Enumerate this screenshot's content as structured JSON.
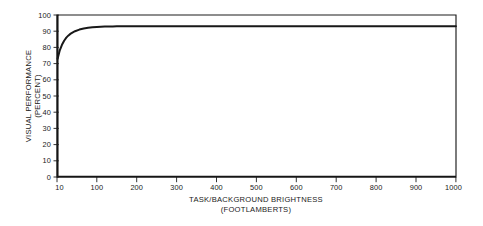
{
  "chart_data": {
    "type": "line",
    "title": "",
    "xlabel": "TASK/BACKGROUND BRIGHTNESS\n(FOOTLAMBERTS)",
    "xlabel_line1": "TASK/BACKGROUND BRIGHTNESS",
    "xlabel_line2": "(FOOTLAMBERTS)",
    "ylabel": "VISUAL PERFORMANCE\n(PERCENT)",
    "ylabel_line1": "VISUAL PERFORMANCE",
    "ylabel_line2": "(PERCENT)",
    "xlim": [
      10,
      1000
    ],
    "ylim": [
      0,
      100
    ],
    "grid": false,
    "legend": "none",
    "x_ticks": [
      10,
      100,
      200,
      300,
      400,
      500,
      600,
      700,
      800,
      900,
      1000
    ],
    "x_tick_labels": [
      "10",
      "100",
      "200",
      "300",
      "400",
      "500",
      "600",
      "700",
      "800",
      "900",
      "1000"
    ],
    "y_ticks": [
      0,
      10,
      20,
      30,
      40,
      50,
      60,
      70,
      80,
      90,
      100
    ],
    "y_tick_labels": [
      "0",
      "10",
      "20",
      "30",
      "40",
      "50",
      "60",
      "70",
      "80",
      "90",
      "100"
    ],
    "series": [
      {
        "name": "Visual performance vs brightness",
        "x": [
          10,
          15,
          20,
          25,
          30,
          35,
          40,
          45,
          50,
          60,
          70,
          80,
          90,
          100,
          110,
          120,
          130,
          140,
          150,
          175,
          200,
          250,
          300,
          350,
          400,
          450,
          500,
          600,
          700,
          800,
          900,
          1000
        ],
        "y": [
          73.0,
          78.2,
          81.6,
          84.1,
          86.0,
          87.4,
          88.5,
          89.3,
          90.0,
          91.0,
          91.7,
          92.1,
          92.4,
          92.6,
          92.75,
          92.85,
          92.9,
          92.95,
          93.0,
          93.0,
          93.0,
          93.0,
          93.0,
          93.0,
          93.0,
          93.0,
          93.0,
          93.0,
          93.0,
          93.0,
          93.0,
          93.0
        ]
      }
    ],
    "asymptote_value": 93,
    "start_value": 73,
    "colors": {
      "curve": "#181818",
      "frame": "#1c1c1c",
      "background": "#ffffff",
      "text": "#1a1a1a"
    }
  }
}
